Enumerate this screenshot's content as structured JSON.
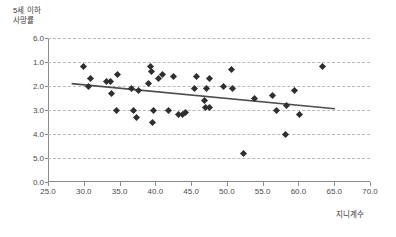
{
  "chart_data": {
    "type": "scatter",
    "title": "",
    "xlabel": "지니계수",
    "ylabel": "5세 이하\n사망률",
    "xlim": [
      25.0,
      70.0
    ],
    "ylim": [
      0.0,
      6.0
    ],
    "y_axis_inverted": true,
    "grid": "horizontal-dashed",
    "legend": null,
    "xticks": [
      "25.0",
      "30.0",
      "35.0",
      "40.0",
      "45.0",
      "50.0",
      "55.0",
      "60.0",
      "65.0",
      "70.0"
    ],
    "xtick_values": [
      25.0,
      30.0,
      35.0,
      40.0,
      45.0,
      50.0,
      55.0,
      60.0,
      65.0,
      70.0
    ],
    "yticks": [
      "6.0",
      "1.0",
      "2.0",
      "3.0",
      "4.0",
      "5.0",
      "0.0"
    ],
    "ytick_values": [
      6.0,
      5.0,
      4.0,
      3.0,
      2.0,
      1.0,
      0.0
    ],
    "series": [
      {
        "name": "countries",
        "marker": "diamond",
        "color": "#2f2f2f",
        "points": [
          [
            30.0,
            4.8
          ],
          [
            30.6,
            4.0
          ],
          [
            31.0,
            4.3
          ],
          [
            33.2,
            4.2
          ],
          [
            33.8,
            4.2
          ],
          [
            33.9,
            3.7
          ],
          [
            34.6,
            3.0
          ],
          [
            34.7,
            4.5
          ],
          [
            36.7,
            3.9
          ],
          [
            37.0,
            3.0
          ],
          [
            37.4,
            2.7
          ],
          [
            37.7,
            3.8
          ],
          [
            39.1,
            4.1
          ],
          [
            39.3,
            4.8
          ],
          [
            39.5,
            4.6
          ],
          [
            39.6,
            2.5
          ],
          [
            39.8,
            3.0
          ],
          [
            40.4,
            4.3
          ],
          [
            41.0,
            4.5
          ],
          [
            41.9,
            3.0
          ],
          [
            42.6,
            4.4
          ],
          [
            43.2,
            2.8
          ],
          [
            43.8,
            2.8
          ],
          [
            44.2,
            2.9
          ],
          [
            45.5,
            3.9
          ],
          [
            45.7,
            4.4
          ],
          [
            46.9,
            3.4
          ],
          [
            47.0,
            3.1
          ],
          [
            47.1,
            3.9
          ],
          [
            47.5,
            4.3
          ],
          [
            47.6,
            3.1
          ],
          [
            49.5,
            4.0
          ],
          [
            50.6,
            4.7
          ],
          [
            50.8,
            3.9
          ],
          [
            52.3,
            1.2
          ],
          [
            53.9,
            3.5
          ],
          [
            56.4,
            3.6
          ],
          [
            57.0,
            3.0
          ],
          [
            58.2,
            2.0
          ],
          [
            58.4,
            3.2
          ],
          [
            59.5,
            3.8
          ],
          [
            60.2,
            2.8
          ],
          [
            63.4,
            4.8
          ]
        ]
      }
    ],
    "trendline": {
      "name": "linear-fit",
      "color": "#4d4d4d",
      "x_start": 28.3,
      "y_start": 4.1,
      "x_end": 65.1,
      "y_end": 3.05
    }
  }
}
